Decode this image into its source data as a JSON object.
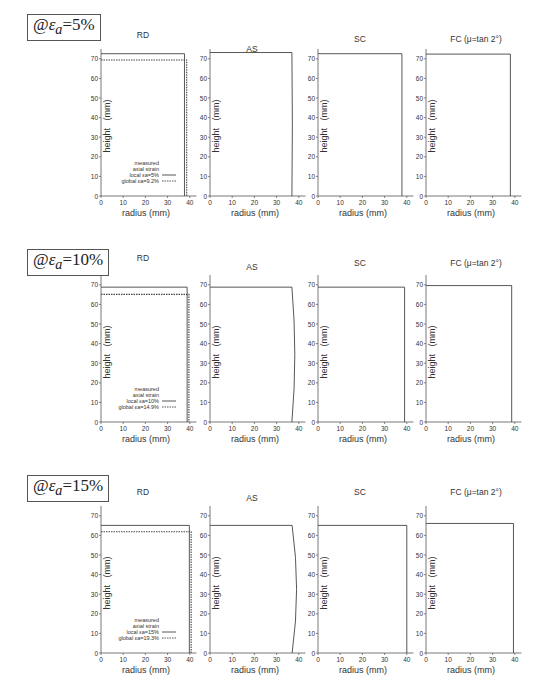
{
  "rows": [
    {
      "label_prefix": "@",
      "label_symbol": "ε",
      "label_sub": "a",
      "label_value": "=5%",
      "top": 14
    },
    {
      "label_prefix": "@",
      "label_symbol": "ε",
      "label_sub": "a",
      "label_value": "=10%",
      "top": 249
    },
    {
      "label_prefix": "@",
      "label_symbol": "ε",
      "label_sub": "a",
      "label_value": "=15%",
      "top": 475
    }
  ],
  "chart_data": [
    {
      "type": "line",
      "row": "@εa=5%",
      "title": "RD",
      "xlabel": "radius   (mm)",
      "ylabel": "height   (mm)",
      "xlim": [
        0,
        43
      ],
      "ylim": [
        0,
        75
      ],
      "xticks": [
        0,
        10,
        20,
        30,
        40
      ],
      "yticks": [
        0,
        10,
        20,
        30,
        40,
        50,
        60,
        70
      ],
      "series": [
        {
          "name": "local εa=5%",
          "style": "solid",
          "radius": 37.6,
          "height": 72.6
        },
        {
          "name": "global εa=9.2%",
          "style": "dotted",
          "radius": 38.6,
          "height": 69.4
        }
      ],
      "legend": {
        "title": [
          "measured",
          "axial strain"
        ],
        "entries": [
          "local εa=5%",
          "global εa=9.2%"
        ]
      }
    },
    {
      "type": "line",
      "row": "@εa=5%",
      "title": "AS",
      "xlabel": "radius   (mm)",
      "ylabel": "height   (mm)",
      "xlim": [
        0,
        43
      ],
      "ylim": [
        0,
        75
      ],
      "xticks": [
        0,
        10,
        20,
        30,
        40
      ],
      "yticks": [
        0,
        10,
        20,
        30,
        40,
        50,
        60,
        70
      ],
      "series": [
        {
          "name": "profile",
          "style": "solid",
          "radius": 36.9,
          "height": 73.2,
          "bulge": 0.2
        }
      ]
    },
    {
      "type": "line",
      "row": "@εa=5%",
      "title": "SC",
      "xlabel": "radius   (mm)",
      "ylabel": "height   (mm)",
      "xlim": [
        0,
        43
      ],
      "ylim": [
        0,
        75
      ],
      "xticks": [
        0,
        10,
        20,
        30,
        40
      ],
      "yticks": [
        0,
        10,
        20,
        30,
        40,
        50,
        60,
        70
      ],
      "series": [
        {
          "name": "profile",
          "style": "solid",
          "radius": 37.8,
          "height": 72.6
        }
      ]
    },
    {
      "type": "line",
      "row": "@εa=5%",
      "title": "FC (μ=tan 2°)",
      "xlabel": "radius   (mm)",
      "ylabel": "height   (mm)",
      "xlim": [
        0,
        43
      ],
      "ylim": [
        0,
        75
      ],
      "xticks": [
        0,
        10,
        20,
        30,
        40
      ],
      "yticks": [
        0,
        10,
        20,
        30,
        40,
        50,
        60,
        70
      ],
      "series": [
        {
          "name": "profile",
          "style": "solid",
          "radius": 38.0,
          "height": 72.4
        }
      ]
    },
    {
      "type": "line",
      "row": "@εa=10%",
      "title": "RD",
      "xlabel": "radius   (mm)",
      "ylabel": "height   (mm)",
      "xlim": [
        0,
        43
      ],
      "ylim": [
        0,
        75
      ],
      "xticks": [
        0,
        10,
        20,
        30,
        40
      ],
      "yticks": [
        0,
        10,
        20,
        30,
        40,
        50,
        60,
        70
      ],
      "series": [
        {
          "name": "local εa=10%",
          "style": "solid",
          "radius": 38.8,
          "height": 68.8
        },
        {
          "name": "global εa=14.9%",
          "style": "dotted",
          "radius": 39.6,
          "height": 65.1
        }
      ],
      "legend": {
        "title": [
          "measured",
          "axial strain"
        ],
        "entries": [
          "local εa=10%",
          "global εa=14.9%"
        ]
      }
    },
    {
      "type": "line",
      "row": "@εa=10%",
      "title": "AS",
      "xlabel": "radius   (mm)",
      "ylabel": "height   (mm)",
      "xlim": [
        0,
        43
      ],
      "ylim": [
        0,
        75
      ],
      "xticks": [
        0,
        10,
        20,
        30,
        40
      ],
      "yticks": [
        0,
        10,
        20,
        30,
        40,
        50,
        60,
        70
      ],
      "series": [
        {
          "name": "profile",
          "style": "solid",
          "radius": 36.9,
          "height": 68.8,
          "bulge": 1.3
        }
      ]
    },
    {
      "type": "line",
      "row": "@εa=10%",
      "title": "SC",
      "xlabel": "radius   (mm)",
      "ylabel": "height   (mm)",
      "xlim": [
        0,
        43
      ],
      "ylim": [
        0,
        75
      ],
      "xticks": [
        0,
        10,
        20,
        30,
        40
      ],
      "yticks": [
        0,
        10,
        20,
        30,
        40,
        50,
        60,
        70
      ],
      "series": [
        {
          "name": "profile",
          "style": "solid",
          "radius": 39.0,
          "height": 68.8
        }
      ]
    },
    {
      "type": "line",
      "row": "@εa=10%",
      "title": "FC (μ=tan 2°)",
      "xlabel": "radius   (mm)",
      "ylabel": "height   (mm)",
      "xlim": [
        0,
        43
      ],
      "ylim": [
        0,
        75
      ],
      "xticks": [
        0,
        10,
        20,
        30,
        40
      ],
      "yticks": [
        0,
        10,
        20,
        30,
        40,
        50,
        60,
        70
      ],
      "series": [
        {
          "name": "profile",
          "style": "solid",
          "radius": 38.6,
          "height": 69.6
        }
      ]
    },
    {
      "type": "line",
      "row": "@εa=15%",
      "title": "RD",
      "xlabel": "radius   (mm)",
      "ylabel": "height   (mm)",
      "xlim": [
        0,
        43
      ],
      "ylim": [
        0,
        75
      ],
      "xticks": [
        0,
        10,
        20,
        30,
        40
      ],
      "yticks": [
        0,
        10,
        20,
        30,
        40,
        50,
        60,
        70
      ],
      "series": [
        {
          "name": "local εa=15%",
          "style": "solid",
          "radius": 39.8,
          "height": 65.1
        },
        {
          "name": "global εa=19.3%",
          "style": "dotted",
          "radius": 40.6,
          "height": 61.9
        }
      ],
      "legend": {
        "title": [
          "measured",
          "axial strain"
        ],
        "entries": [
          "local εa=15%",
          "global εa=19.3%"
        ]
      }
    },
    {
      "type": "line",
      "row": "@εa=15%",
      "title": "AS",
      "xlabel": "radius   (mm)",
      "ylabel": "height   (mm)",
      "xlim": [
        0,
        43
      ],
      "ylim": [
        0,
        75
      ],
      "xticks": [
        0,
        10,
        20,
        30,
        40
      ],
      "yticks": [
        0,
        10,
        20,
        30,
        40,
        50,
        60,
        70
      ],
      "series": [
        {
          "name": "profile",
          "style": "solid",
          "radius": 37.0,
          "height": 65.1,
          "bulge": 2.0
        }
      ]
    },
    {
      "type": "line",
      "row": "@εa=15%",
      "title": "SC",
      "xlabel": "radius   (mm)",
      "ylabel": "height   (mm)",
      "xlim": [
        0,
        43
      ],
      "ylim": [
        0,
        75
      ],
      "xticks": [
        0,
        10,
        20,
        30,
        40
      ],
      "yticks": [
        0,
        10,
        20,
        30,
        40,
        50,
        60,
        70
      ],
      "series": [
        {
          "name": "profile",
          "style": "solid",
          "radius": 40.0,
          "height": 65.1
        }
      ]
    },
    {
      "type": "line",
      "row": "@εa=15%",
      "title": "FC (μ=tan 2°)",
      "xlabel": "radius   (mm)",
      "ylabel": "height   (mm)",
      "xlim": [
        0,
        43
      ],
      "ylim": [
        0,
        75
      ],
      "xticks": [
        0,
        10,
        20,
        30,
        40
      ],
      "yticks": [
        0,
        10,
        20,
        30,
        40,
        50,
        60,
        70
      ],
      "series": [
        {
          "name": "profile",
          "style": "solid",
          "radius": 39.4,
          "height": 66.1
        }
      ]
    }
  ],
  "layout": {
    "panel_x": [
      101,
      210,
      318,
      426
    ],
    "row_y0": [
      196,
      422,
      653
    ],
    "row_ytitle": [
      [
        30,
        44,
        40,
        40
      ],
      [
        257,
        270,
        266,
        266
      ],
      [
        491,
        501,
        495,
        495
      ]
    ],
    "px_per_unit_x": 2.22,
    "px_per_unit_y": 1.96
  },
  "colors": {
    "axis": "#555555",
    "line": "#444444",
    "text": "#333333"
  }
}
